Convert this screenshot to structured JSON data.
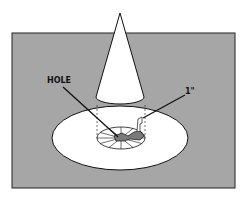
{
  "diagram": {
    "labels": {
      "hole": "HOLE",
      "measure": "1\""
    },
    "colors": {
      "background": "#a6a6a6",
      "fill": "#ffffff",
      "stroke": "#111111",
      "hole_fill": "#7a7a7a"
    }
  }
}
